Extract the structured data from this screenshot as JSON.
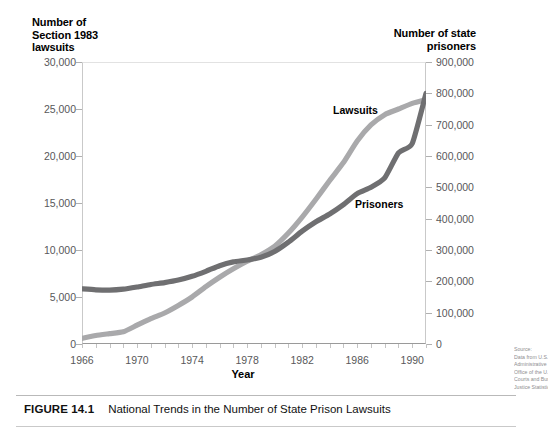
{
  "figure": {
    "caption_number": "FIGURE 14.1",
    "caption_text": "National Trends in the Number of State Prison Lawsuits"
  },
  "source_note": {
    "lines": [
      "Source:",
      "Data from U.S.",
      "Administrative",
      "Office of the U.S.",
      "Courts and Bureau of",
      "Justice Statistics."
    ]
  },
  "chart_data": {
    "type": "line",
    "title": "National Trends in the Number of State Prison Lawsuits",
    "xlabel": "Year",
    "ylabel": "Number of Section 1983 lawsuits",
    "y2label": "Number of state prisoners",
    "grid": false,
    "legend": "inline-labels",
    "xlim": [
      1966,
      1991
    ],
    "ylim": [
      0,
      30000
    ],
    "y2lim": [
      0,
      900000
    ],
    "xticks": [
      1966,
      1970,
      1974,
      1978,
      1982,
      1986,
      1990
    ],
    "xticklabels": [
      "1966",
      "1970",
      "1974",
      "1978",
      "1982",
      "1986",
      "1990"
    ],
    "xtick_minor_step": 1,
    "yticks": [
      0,
      5000,
      10000,
      15000,
      20000,
      25000,
      30000
    ],
    "yticklabels": [
      "0",
      "5,000",
      "10,000",
      "15,000",
      "20,000",
      "25,000",
      "30,000"
    ],
    "y2ticks": [
      0,
      100000,
      200000,
      300000,
      400000,
      500000,
      600000,
      700000,
      800000,
      900000
    ],
    "y2ticklabels": [
      "0",
      "100,000",
      "200,000",
      "300,000",
      "400,000",
      "500,000",
      "600,000",
      "700,000",
      "800,000",
      "900,000"
    ],
    "x": [
      1966,
      1967,
      1968,
      1969,
      1970,
      1971,
      1972,
      1973,
      1974,
      1975,
      1976,
      1977,
      1978,
      1979,
      1980,
      1981,
      1982,
      1983,
      1984,
      1985,
      1986,
      1987,
      1988,
      1989,
      1990,
      1991
    ],
    "series": [
      {
        "name": "Lawsuits",
        "axis": "left",
        "color": "#a9a9ab",
        "unit": "Section 1983 lawsuits",
        "values": [
          600,
          900,
          1100,
          1300,
          2000,
          2700,
          3300,
          4100,
          5000,
          6100,
          7100,
          8000,
          8800,
          9500,
          10400,
          11800,
          13500,
          15400,
          17400,
          19300,
          21600,
          23300,
          24400,
          25000,
          25600,
          26000
        ]
      },
      {
        "name": "Prisoners",
        "axis": "right",
        "color": "#6f6f71",
        "unit": "state prisoners",
        "values": [
          176000,
          173000,
          172000,
          175000,
          182000,
          190000,
          196000,
          204000,
          216000,
          232000,
          250000,
          262000,
          268000,
          277000,
          295000,
          325000,
          360000,
          390000,
          415000,
          445000,
          480000,
          500000,
          530000,
          610000,
          640000,
          800000
        ],
        "values_left_scale": [
          5870,
          5770,
          5730,
          5830,
          6070,
          6330,
          6530,
          6800,
          7200,
          7730,
          8330,
          8730,
          8930,
          9230,
          9830,
          10830,
          12000,
          13000,
          13830,
          14830,
          16000,
          16670,
          17670,
          20330,
          21330,
          26670
        ]
      }
    ],
    "annotations": [
      {
        "text": "Lawsuits",
        "x": 1985.3,
        "y_axis": "left",
        "y": 24000
      },
      {
        "text": "Prisoners",
        "x": 1986.8,
        "y_axis": "left",
        "y": 14600
      }
    ]
  },
  "axes": {
    "left_title_lines": [
      "Number of",
      "Section 1983",
      "lawsuits"
    ],
    "right_title_lines": [
      "Number of state",
      "prisoners"
    ],
    "x_title": "Year"
  }
}
